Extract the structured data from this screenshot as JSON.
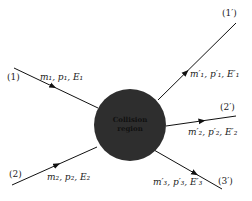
{
  "diagram": {
    "title": "",
    "region": {
      "label_line1": "Collision",
      "label_line2": "region",
      "fill": "#2e2e2e"
    },
    "incoming": [
      {
        "id": "(1)",
        "label": "m₁, p₁, E₁"
      },
      {
        "id": "(2)",
        "label": "m₂, p₂, E₂"
      }
    ],
    "outgoing": [
      {
        "id": "(1′)",
        "label": "m′₁, p′₁, E′₁"
      },
      {
        "id": "(2′)",
        "label": "m′₂, p′₂, E′₂"
      },
      {
        "id": "(3′)",
        "label": "m′₃, p′₃, E′₃"
      }
    ],
    "line_color": "#111111"
  }
}
